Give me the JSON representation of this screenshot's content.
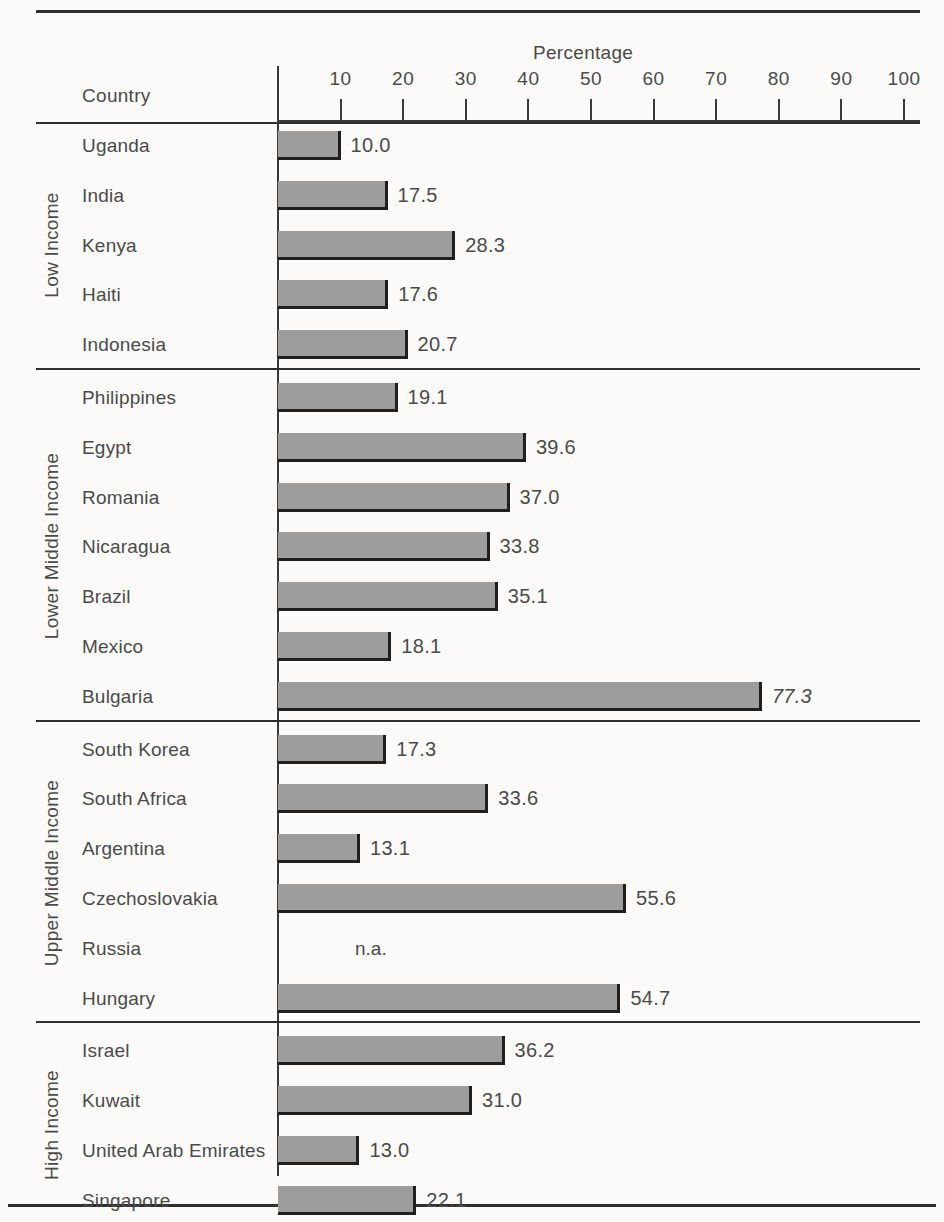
{
  "chart_data": {
    "type": "bar",
    "orientation": "horizontal",
    "title": "",
    "xlabel": "Percentage",
    "ylabel": "Country",
    "xlim": [
      0,
      100
    ],
    "xticks": [
      10,
      20,
      30,
      40,
      50,
      60,
      70,
      80,
      90,
      100
    ],
    "grid": false,
    "legend": null,
    "bar_color": "#9d9d9d",
    "groups": [
      {
        "label": "Low Income",
        "categories": [
          "Uganda",
          "India",
          "Kenya",
          "Haiti",
          "Indonesia"
        ],
        "values": [
          10.0,
          17.5,
          28.3,
          17.6,
          20.7
        ],
        "labels": [
          "10.0",
          "17.5",
          "28.3",
          "17.6",
          "20.7"
        ]
      },
      {
        "label": "Lower Middle Income",
        "categories": [
          "Philippines",
          "Egypt",
          "Romania",
          "Nicaragua",
          "Brazil",
          "Mexico",
          "Bulgaria"
        ],
        "values": [
          19.1,
          39.6,
          37.0,
          33.8,
          35.1,
          18.1,
          77.3
        ],
        "labels": [
          "19.1",
          "39.6",
          "37.0",
          "33.8",
          "35.1",
          "18.1",
          "77.3"
        ]
      },
      {
        "label": "Upper Middle Income",
        "categories": [
          "South Korea",
          "South Africa",
          "Argentina",
          "Czechoslovakia",
          "Russia",
          "Hungary"
        ],
        "values": [
          17.3,
          33.6,
          13.1,
          55.6,
          null,
          54.7
        ],
        "labels": [
          "17.3",
          "33.6",
          "13.1",
          "55.6",
          "n.a.",
          "54.7"
        ]
      },
      {
        "label": "High Income",
        "categories": [
          "Israel",
          "Kuwait",
          "United Arab Emirates",
          "Singapore"
        ],
        "values": [
          36.2,
          31.0,
          13.0,
          22.1
        ],
        "labels": [
          "36.2",
          "31.0",
          "13.0",
          "22.1"
        ]
      }
    ]
  }
}
